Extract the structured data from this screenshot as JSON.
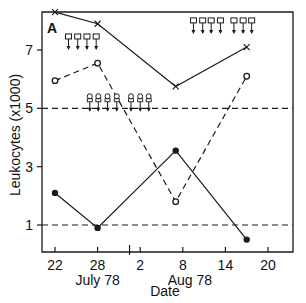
{
  "chart_data": {
    "type": "line",
    "panel_label": "A",
    "title": "",
    "xlabel": "Date",
    "ylabel": "Leukocytes (x1000)",
    "x_ticks": [
      {
        "label": "22",
        "day": 0
      },
      {
        "label": "28",
        "day": 6
      },
      {
        "label": "2",
        "day": 12
      },
      {
        "label": "8",
        "day": 18
      },
      {
        "label": "14",
        "day": 24
      },
      {
        "label": "20",
        "day": 30
      }
    ],
    "month_labels": [
      {
        "label": "July 78",
        "day": 6
      },
      {
        "label": "Aug 78",
        "day": 19
      }
    ],
    "month_break_day": 10.5,
    "y_ticks": [
      1,
      3,
      5,
      7
    ],
    "xlim": [
      -2,
      34
    ],
    "ylim": [
      0,
      8.5
    ],
    "reference_lines": [
      {
        "y": 5,
        "style": "dashed"
      },
      {
        "y": 1,
        "style": "dashed"
      }
    ],
    "series": [
      {
        "name": "x-marker (solid)",
        "marker": "x",
        "line": "solid",
        "x": [
          "Jul 22",
          "Jul 28",
          "Aug 7",
          "Aug 17"
        ],
        "days": [
          0,
          6,
          17,
          27
        ],
        "values": [
          8.3,
          7.9,
          5.75,
          7.1
        ]
      },
      {
        "name": "open-circle (dashed)",
        "marker": "open-circle",
        "line": "dashed",
        "x": [
          "Jul 22",
          "Jul 28",
          "Aug 7",
          "Aug 17"
        ],
        "days": [
          0,
          6,
          17,
          27
        ],
        "values": [
          5.95,
          6.55,
          1.8,
          6.1
        ]
      },
      {
        "name": "filled-circle (solid)",
        "marker": "filled-circle",
        "line": "solid",
        "x": [
          "Jul 22",
          "Jul 28",
          "Aug 7",
          "Aug 17"
        ],
        "days": [
          0,
          6,
          17,
          27
        ],
        "values": [
          2.1,
          0.9,
          3.55,
          0.5
        ]
      }
    ],
    "annotations": [
      {
        "type": "square-arrow",
        "count": 4,
        "days": [
          1.9,
          3.2,
          4.5,
          5.8
        ],
        "y_top": 7.55
      },
      {
        "type": "circle-arrow",
        "count": 4,
        "days": [
          4.9,
          6.1,
          7.4,
          8.7
        ],
        "y_top": 5.5
      },
      {
        "type": "circle-arrow",
        "count": 3,
        "days": [
          10.7,
          12.0,
          13.2
        ],
        "y_top": 5.5
      },
      {
        "type": "square-arrow",
        "count": 4,
        "days": [
          19.5,
          20.8,
          22.0,
          23.3
        ],
        "y_top": 8.1
      },
      {
        "type": "square-arrow",
        "count": 3,
        "days": [
          25.2,
          26.5,
          27.7
        ],
        "y_top": 8.1
      }
    ],
    "grid": false,
    "legend": "none"
  },
  "colors": {
    "ink": "#1a1a1a",
    "background": "#ffffff"
  }
}
